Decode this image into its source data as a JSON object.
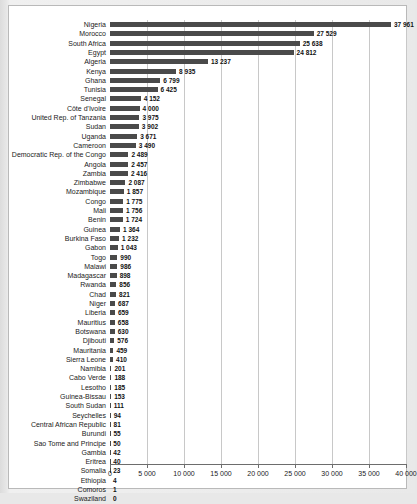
{
  "chart_data": {
    "type": "bar",
    "orientation": "horizontal",
    "title": "",
    "subtitle": "",
    "xlabel": "",
    "ylabel": "",
    "xlim": [
      0,
      40000
    ],
    "xticks": [
      0,
      5000,
      10000,
      15000,
      20000,
      25000,
      30000,
      35000,
      40000
    ],
    "xticklabels": [
      "0",
      "5 000",
      "10 000",
      "15 000",
      "20 000",
      "25 000",
      "30 000",
      "35 000",
      "40 000"
    ],
    "grid": true,
    "grid_axis": "x",
    "legend": null,
    "bar_color": "#4a4a4a",
    "categories": [
      "Nigeria",
      "Morocco",
      "South Africa",
      "Egypt",
      "Algeria",
      "Kenya",
      "Ghana",
      "Tunisia",
      "Senegal",
      "Côte d'Ivoire",
      "United Rep. of Tanzania",
      "Sudan",
      "Uganda",
      "Cameroon",
      "Democratic Rep. of the Congo",
      "Angola",
      "Zambia",
      "Zimbabwe",
      "Mozambique",
      "Congo",
      "Mali",
      "Benin",
      "Guinea",
      "Burkina Faso",
      "Gabon",
      "Togo",
      "Malawi",
      "Madagascar",
      "Rwanda",
      "Chad",
      "Niger",
      "Liberia",
      "Mauritius",
      "Botswana",
      "Djibouti",
      "Mauritania",
      "Sierra Leone",
      "Namibia",
      "Cabo Verde",
      "Lesotho",
      "Guinea-Bissau",
      "South Sudan",
      "Seychelles",
      "Central African Republic",
      "Burundi",
      "Sao Tome and Principe",
      "Gambia",
      "Eritrea",
      "Somalia",
      "Ethiopia",
      "Comoros",
      "Swaziland"
    ],
    "values": [
      37961,
      27529,
      25638,
      24812,
      13237,
      8935,
      6799,
      6425,
      4152,
      4000,
      3975,
      3902,
      3671,
      3490,
      2489,
      2457,
      2416,
      2087,
      1857,
      1775,
      1756,
      1724,
      1364,
      1232,
      1043,
      990,
      986,
      898,
      856,
      821,
      687,
      659,
      658,
      630,
      576,
      459,
      410,
      201,
      188,
      185,
      153,
      111,
      94,
      81,
      55,
      50,
      42,
      40,
      23,
      4,
      1,
      0
    ],
    "value_labels": [
      "37 961",
      "27 529",
      "25 638",
      "24 812",
      "13 237",
      "8 935",
      "6 799",
      "6 425",
      "4 152",
      "4 000",
      "3 975",
      "3 902",
      "3 671",
      "3 490",
      "2 489",
      "2 457",
      "2 416",
      "2 087",
      "1 857",
      "1 775",
      "1 756",
      "1 724",
      "1 364",
      "1 232",
      "1 043",
      "990",
      "986",
      "898",
      "856",
      "821",
      "687",
      "659",
      "658",
      "630",
      "576",
      "459",
      "410",
      "201",
      "188",
      "185",
      "153",
      "111",
      "94",
      "81",
      "55",
      "50",
      "42",
      "40",
      "23",
      "4",
      "1",
      "0"
    ]
  }
}
